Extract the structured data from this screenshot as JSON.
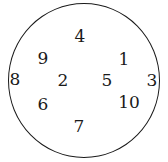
{
  "diagram": {
    "shape": "circle",
    "stroke_color": "#1a1a1a",
    "labels": [
      {
        "text": "4",
        "x": 80,
        "y": 36
      },
      {
        "text": "9",
        "x": 43,
        "y": 58
      },
      {
        "text": "1",
        "x": 124,
        "y": 59
      },
      {
        "text": "8",
        "x": 15,
        "y": 79
      },
      {
        "text": "2",
        "x": 63,
        "y": 80
      },
      {
        "text": "5",
        "x": 107,
        "y": 80
      },
      {
        "text": "3",
        "x": 152,
        "y": 80
      },
      {
        "text": "6",
        "x": 43,
        "y": 104
      },
      {
        "text": "10",
        "x": 129,
        "y": 102
      },
      {
        "text": "7",
        "x": 79,
        "y": 126
      }
    ]
  }
}
